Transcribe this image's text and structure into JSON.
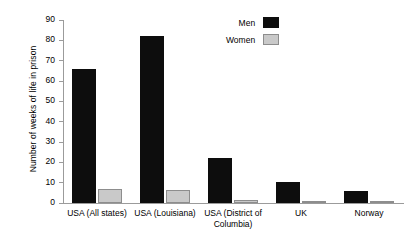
{
  "chart_data": {
    "type": "bar",
    "title": "",
    "xlabel": "",
    "ylabel": "Number of weeks of life in prison",
    "ylim": [
      0,
      90
    ],
    "ytick_step": 10,
    "yticks": [
      90,
      80,
      70,
      60,
      50,
      40,
      30,
      20,
      10,
      0
    ],
    "grid": false,
    "legend_position": "top-right",
    "categories": [
      "USA (All states)",
      "USA (Louisiana)",
      "USA (District of Columbia)",
      "UK",
      "Norway"
    ],
    "category_lines": [
      [
        "USA (All states)"
      ],
      [
        "USA (Louisiana)"
      ],
      [
        "USA (District of",
        "Columbia)"
      ],
      [
        "UK"
      ],
      [
        "Norway"
      ]
    ],
    "series": [
      {
        "name": "Men",
        "color": "#0d0d0d",
        "values": [
          66,
          82,
          22,
          10.5,
          6
        ]
      },
      {
        "name": "Women",
        "color": "#c9c9c9",
        "values": [
          6.8,
          6.3,
          1.3,
          0.6,
          0.6
        ]
      }
    ]
  },
  "legend": {
    "items": [
      {
        "label": "Men",
        "swatch": "men"
      },
      {
        "label": "Women",
        "swatch": "women"
      }
    ]
  },
  "colors": {
    "men": "#0d0d0d",
    "women": "#c9c9c9",
    "women_outline": "#8d8d8d",
    "axis": "#9b9b9b",
    "background": "#ffffff",
    "text": "#000000"
  }
}
